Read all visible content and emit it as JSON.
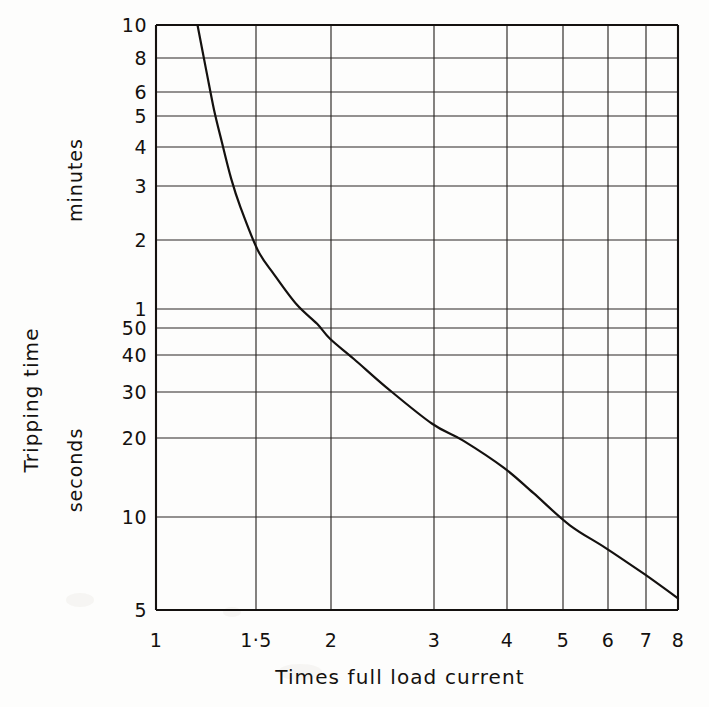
{
  "figure": {
    "background_color": "#fdfdfc",
    "ink_color": "#14110f",
    "y_axis_title": "Tripping time",
    "y_unit_upper": "minutes",
    "y_unit_lower": "seconds",
    "x_axis_title": "Times full load current"
  },
  "chart_data": {
    "type": "line",
    "title": "",
    "xlabel": "Times full load current",
    "ylabel": "Tripping time",
    "y_unit_upper": "minutes",
    "y_unit_lower": "seconds",
    "xscale": "log",
    "yscale": "log",
    "xlim": [
      1,
      8
    ],
    "ylim_seconds": [
      5,
      600
    ],
    "grid": true,
    "legend": "none",
    "x_ticks": [
      {
        "value": 1,
        "label": "1"
      },
      {
        "value": 1.5,
        "label": "1·5"
      },
      {
        "value": 2,
        "label": "2"
      },
      {
        "value": 3,
        "label": "3"
      },
      {
        "value": 4,
        "label": "4"
      },
      {
        "value": 5,
        "label": "5"
      },
      {
        "value": 6,
        "label": "6"
      },
      {
        "value": 7,
        "label": "7"
      },
      {
        "value": 8,
        "label": "8"
      }
    ],
    "y_ticks": [
      {
        "seconds": 600,
        "label": "10",
        "unit": "minutes"
      },
      {
        "seconds": 480,
        "label": "8",
        "unit": "minutes"
      },
      {
        "seconds": 360,
        "label": "6",
        "unit": "minutes"
      },
      {
        "seconds": 300,
        "label": "5",
        "unit": "minutes"
      },
      {
        "seconds": 240,
        "label": "4",
        "unit": "minutes"
      },
      {
        "seconds": 180,
        "label": "3",
        "unit": "minutes"
      },
      {
        "seconds": 120,
        "label": "2",
        "unit": "minutes"
      },
      {
        "seconds": 60,
        "label": "1",
        "unit": "minutes"
      },
      {
        "seconds": 50,
        "label": "50",
        "unit": "seconds"
      },
      {
        "seconds": 40,
        "label": "40",
        "unit": "seconds"
      },
      {
        "seconds": 30,
        "label": "30",
        "unit": "seconds"
      },
      {
        "seconds": 20,
        "label": "20",
        "unit": "seconds"
      },
      {
        "seconds": 10,
        "label": "10",
        "unit": "seconds"
      },
      {
        "seconds": 5,
        "label": "5",
        "unit": "seconds"
      }
    ],
    "series": [
      {
        "name": "Tripping characteristic",
        "points": [
          {
            "x": 1.18,
            "y_seconds": 600
          },
          {
            "x": 1.22,
            "y_seconds": 420
          },
          {
            "x": 1.26,
            "y_seconds": 300
          },
          {
            "x": 1.3,
            "y_seconds": 230
          },
          {
            "x": 1.35,
            "y_seconds": 170
          },
          {
            "x": 1.4,
            "y_seconds": 135
          },
          {
            "x": 1.5,
            "y_seconds": 95
          },
          {
            "x": 1.6,
            "y_seconds": 78
          },
          {
            "x": 1.75,
            "y_seconds": 61
          },
          {
            "x": 1.9,
            "y_seconds": 52
          },
          {
            "x": 2.0,
            "y_seconds": 46
          },
          {
            "x": 2.2,
            "y_seconds": 39
          },
          {
            "x": 2.5,
            "y_seconds": 31
          },
          {
            "x": 3.0,
            "y_seconds": 23
          },
          {
            "x": 3.4,
            "y_seconds": 20
          },
          {
            "x": 4.0,
            "y_seconds": 16
          },
          {
            "x": 4.5,
            "y_seconds": 13
          },
          {
            "x": 5.2,
            "y_seconds": 10
          },
          {
            "x": 6.0,
            "y_seconds": 8.3
          },
          {
            "x": 7.0,
            "y_seconds": 6.7
          },
          {
            "x": 8.0,
            "y_seconds": 5.5
          }
        ]
      }
    ]
  }
}
